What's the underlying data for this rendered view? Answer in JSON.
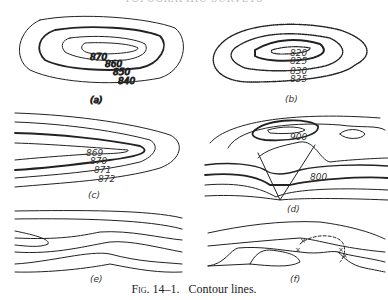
{
  "header": "TOPOGRAPHIC SURVEYS",
  "panels": [
    {
      "id": "a",
      "label": "(a)",
      "contours": [
        "870",
        "860",
        "850",
        "840"
      ]
    },
    {
      "id": "b",
      "label": "(b)",
      "contours": [
        "820",
        "825",
        "830",
        "835"
      ]
    },
    {
      "id": "c",
      "label": "(c)",
      "contours": [
        "869",
        "870",
        "871",
        "872"
      ]
    },
    {
      "id": "d",
      "label": "(d)",
      "contours": [
        "900",
        "800"
      ]
    },
    {
      "id": "e",
      "label": "(e)",
      "contours": []
    },
    {
      "id": "f",
      "label": "(f)",
      "contours": []
    }
  ],
  "caption": {
    "fig": "Fig. 14–1.",
    "text": "Contour lines."
  }
}
